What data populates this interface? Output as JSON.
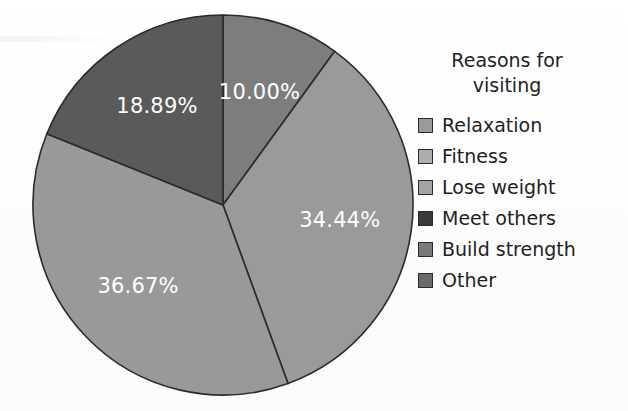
{
  "chart_data": {
    "type": "pie",
    "title": "",
    "legend_title": "Reasons for\nvisiting",
    "legend_position": "right",
    "start_angle_deg": 0,
    "direction": "clockwise",
    "categories": [
      "Relaxation",
      "Fitness",
      "Lose weight",
      "Meet others",
      "Build strength",
      "Other"
    ],
    "values": [
      34.44,
      36.67,
      18.89,
      0,
      0,
      10.0
    ],
    "labels": [
      "34.44%",
      "36.67%",
      "18.89%",
      "",
      "",
      "10.00%"
    ],
    "colors": [
      "#9a9a9a",
      "#999999",
      "#5a5a5a",
      "#3a3a3a",
      "#7a7a7a",
      "#7d7d7d"
    ],
    "units": "percent",
    "slices_drawn": [
      {
        "label": "10.00%",
        "value": 10.0,
        "category": "Other",
        "color": "#7d7d7d",
        "start_deg": 0,
        "end_deg": 36
      },
      {
        "label": "34.44%",
        "value": 34.44,
        "category": "Relaxation",
        "color": "#9a9a9a",
        "start_deg": 36,
        "end_deg": 160
      },
      {
        "label": "36.67%",
        "value": 36.67,
        "category": "Fitness",
        "color": "#999999",
        "start_deg": 160,
        "end_deg": 292
      },
      {
        "label": "18.89%",
        "value": 18.89,
        "category": "Lose weight",
        "color": "#5a5a5a",
        "start_deg": 292,
        "end_deg": 360
      }
    ]
  },
  "legend": {
    "title": "Reasons for\nvisiting",
    "items": [
      {
        "label": "Relaxation",
        "color": "#9a9a9a"
      },
      {
        "label": "Fitness",
        "color": "#adadad"
      },
      {
        "label": "Lose weight",
        "color": "#a3a3a3"
      },
      {
        "label": "Meet others",
        "color": "#3a3a3a"
      },
      {
        "label": "Build strength",
        "color": "#7a7a7a"
      },
      {
        "label": "Other",
        "color": "#6a6a6a"
      }
    ]
  },
  "style": {
    "background": "#fcfcfc",
    "slice_border": "#2b2b2b",
    "label_text_color": "#ffffff",
    "legend_text_color": "#1f1f1f"
  }
}
